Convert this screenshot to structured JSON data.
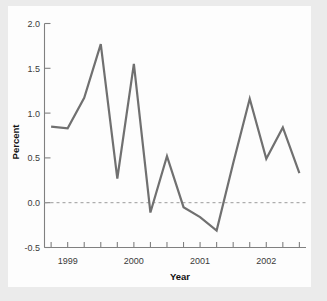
{
  "figure": {
    "background_color": "#ebebeb",
    "panel_color": "#fdfdfd",
    "line_color": "#707070",
    "axis_color": "#808080",
    "zero_line_color": "#9a9a9a"
  },
  "chart_data": {
    "type": "line",
    "title": "",
    "xlabel": "Year",
    "ylabel": "Percent",
    "xlim": [
      1998.65,
      2002.6
    ],
    "ylim": [
      -0.5,
      2.0
    ],
    "yticks": [
      -0.5,
      0.0,
      0.5,
      1.0,
      1.5,
      2.0
    ],
    "ytick_labels": [
      "-0.5",
      "0.0",
      "0.5",
      "1.0",
      "1.5",
      "2.0"
    ],
    "xticks": [
      1999,
      2000,
      2001,
      2002
    ],
    "xtick_labels": [
      "1999",
      "2000",
      "2001",
      "2002"
    ],
    "xminor_ticks": [
      1998.75,
      1999.0,
      1999.25,
      1999.5,
      1999.75,
      2000.0,
      2000.25,
      2000.5,
      2000.75,
      2001.0,
      2001.25,
      2001.5,
      2001.75,
      2002.0,
      2002.25,
      2002.5
    ],
    "grid": false,
    "legend": null,
    "reference_lines": [
      {
        "name": "zero-line",
        "y": 0.0,
        "style": "dashed"
      }
    ],
    "series": [
      {
        "name": "Percent",
        "x": [
          1998.75,
          1999.0,
          1999.25,
          1999.5,
          1999.75,
          2000.0,
          2000.25,
          2000.5,
          2000.75,
          2001.0,
          2001.25,
          2001.5,
          2001.75,
          2002.0,
          2002.25,
          2002.5
        ],
        "values": [
          0.85,
          0.83,
          1.17,
          1.77,
          0.27,
          1.55,
          -0.11,
          0.52,
          -0.05,
          -0.16,
          -0.31,
          0.44,
          1.16,
          0.49,
          0.84,
          0.33
        ]
      }
    ]
  },
  "axis_labels": {
    "x_title": "Year",
    "y_title": "Percent"
  }
}
